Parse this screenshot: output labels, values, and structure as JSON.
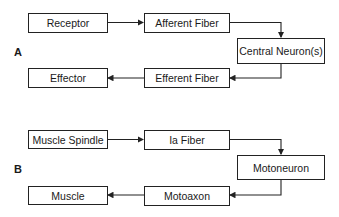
{
  "panel_a": {
    "label": "A",
    "receptor": "Receptor",
    "afferent": "Afferent Fiber",
    "central": "Central Neuron(s)",
    "efferent": "Efferent Fiber",
    "effector": "Effector"
  },
  "panel_b": {
    "label": "B",
    "receptor": "Muscle Spindle",
    "afferent": "Ia Fiber",
    "central": "Motoneuron",
    "efferent": "Motoaxon",
    "effector": "Muscle"
  },
  "colors": {
    "line": "#222222",
    "background": "#ffffff"
  }
}
